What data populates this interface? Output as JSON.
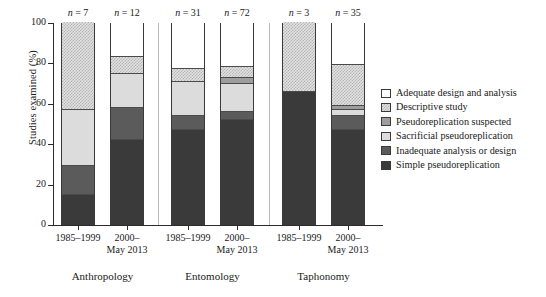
{
  "chart_data": {
    "type": "bar",
    "subtype": "stacked-bar-100pct",
    "title": "",
    "xlabel": "",
    "ylabel": "Studies examined (%)",
    "ylim": [
      0,
      100
    ],
    "yticks": [
      0,
      20,
      40,
      60,
      80,
      100
    ],
    "grid": false,
    "legend_position": "right",
    "categories": [
      "Anthropology 1985–1999",
      "Anthropology 2000–May 2013",
      "Entomology 1985–1999",
      "Entomology 2000–May 2013",
      "Taphonomy 1985–1999",
      "Taphonomy 2000–May 2013"
    ],
    "groups": [
      {
        "name": "Anthropology",
        "bars": [
          {
            "period": "1985–1999",
            "n_label": "n = 7",
            "n": 7
          },
          {
            "period": "2000–\nMay 2013",
            "n_label": "n = 12",
            "n": 12
          }
        ]
      },
      {
        "name": "Entomology",
        "bars": [
          {
            "period": "1985–1999",
            "n_label": "n = 31",
            "n": 31
          },
          {
            "period": "2000–\nMay 2013",
            "n_label": "n = 72",
            "n": 72
          }
        ]
      },
      {
        "name": "Taphonomy",
        "bars": [
          {
            "period": "1985–1999",
            "n_label": "n = 3",
            "n": 3
          },
          {
            "period": "2000–\nMay 2013",
            "n_label": "n = 35",
            "n": 35
          }
        ]
      }
    ],
    "series": [
      {
        "name": "Adequate design and analysis",
        "key": "adequate",
        "color": "#ffffff",
        "values": [
          0,
          17,
          23,
          22,
          0,
          21
        ]
      },
      {
        "name": "Descriptive study",
        "key": "descriptive",
        "color": "#e2e2e2",
        "values": [
          43,
          8,
          6,
          5,
          34,
          20
        ]
      },
      {
        "name": "Pseudoreplication suspected",
        "key": "suspected",
        "color": "#9d9d9d",
        "values": [
          0,
          0,
          0,
          3,
          0,
          2
        ]
      },
      {
        "name": "Sacrificial pseudoreplication",
        "key": "sacrificial",
        "color": "#dcdcdc",
        "values": [
          28,
          17,
          17,
          14,
          0,
          3
        ]
      },
      {
        "name": "Inadequate analysis or design",
        "key": "inadequate",
        "color": "#5b5b5b",
        "values": [
          14,
          16,
          7,
          4,
          0,
          7
        ]
      },
      {
        "name": "Simple pseudoreplication",
        "key": "simple",
        "color": "#3a3a3a",
        "values": [
          15,
          42,
          47,
          52,
          66,
          47
        ]
      }
    ],
    "stack_order_bottom_to_top": [
      "Simple pseudoreplication",
      "Inadequate analysis or design",
      "Sacrificial pseudoreplication",
      "Pseudoreplication suspected",
      "Descriptive study",
      "Adequate design and analysis"
    ]
  },
  "axis": {
    "y_label": "Studies examined (%)",
    "y_ticks": [
      "100",
      "80",
      "60",
      "40",
      "20",
      "0"
    ]
  },
  "bars": [
    {
      "n_label": "n = 7",
      "period_line1": "1985–1999",
      "period_line2": ""
    },
    {
      "n_label": "n = 12",
      "period_line1": "2000–",
      "period_line2": "May 2013"
    },
    {
      "n_label": "n = 31",
      "period_line1": "1985–1999",
      "period_line2": ""
    },
    {
      "n_label": "n = 72",
      "period_line1": "2000–",
      "period_line2": "May 2013"
    },
    {
      "n_label": "n = 3",
      "period_line1": "1985–1999",
      "period_line2": ""
    },
    {
      "n_label": "n = 35",
      "period_line1": "2000–",
      "period_line2": "May 2013"
    }
  ],
  "groups": [
    {
      "label": "Anthropology"
    },
    {
      "label": "Entomology"
    },
    {
      "label": "Taphonomy"
    }
  ],
  "legend": {
    "items": [
      {
        "label": "Adequate design and analysis",
        "key": "adequate"
      },
      {
        "label": "Descriptive study",
        "key": "descriptive"
      },
      {
        "label": "Pseudoreplication suspected",
        "key": "suspected"
      },
      {
        "label": "Sacrificial pseudoreplication",
        "key": "sacrificial"
      },
      {
        "label": "Inadequate analysis or design",
        "key": "inadequate"
      },
      {
        "label": "Simple pseudoreplication",
        "key": "simple"
      }
    ]
  }
}
